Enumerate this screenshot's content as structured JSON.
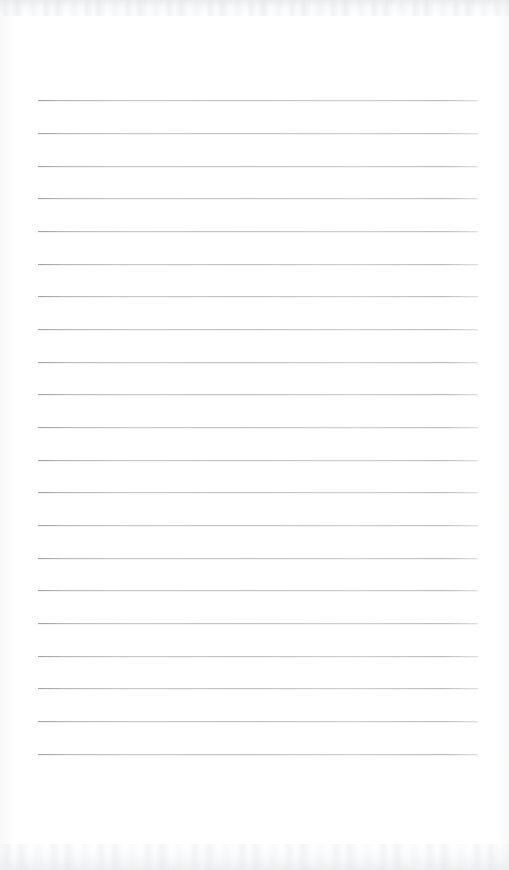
{
  "document": {
    "kind": "lined-notepad-page",
    "title": "",
    "content_text": "",
    "page_width": 509,
    "page_height": 870,
    "background_color": "#ffffff",
    "rule_color": "#b3b6bd",
    "rule_count": 21,
    "rule_left_x": 38,
    "rule_right_x": 478,
    "rule_first_y": 100,
    "rule_spacing": 32.65,
    "rule_thickness": 1,
    "has_margin_line": false,
    "is_blank": true
  },
  "rules": [
    {
      "index": 1,
      "y": 100,
      "text": ""
    },
    {
      "index": 2,
      "y": 133,
      "text": ""
    },
    {
      "index": 3,
      "y": 166,
      "text": ""
    },
    {
      "index": 4,
      "y": 198,
      "text": ""
    },
    {
      "index": 5,
      "y": 231,
      "text": ""
    },
    {
      "index": 6,
      "y": 264,
      "text": ""
    },
    {
      "index": 7,
      "y": 296,
      "text": ""
    },
    {
      "index": 8,
      "y": 329,
      "text": ""
    },
    {
      "index": 9,
      "y": 362,
      "text": ""
    },
    {
      "index": 10,
      "y": 394,
      "text": ""
    },
    {
      "index": 11,
      "y": 427,
      "text": ""
    },
    {
      "index": 12,
      "y": 460,
      "text": ""
    },
    {
      "index": 13,
      "y": 492,
      "text": ""
    },
    {
      "index": 14,
      "y": 525,
      "text": ""
    },
    {
      "index": 15,
      "y": 558,
      "text": ""
    },
    {
      "index": 16,
      "y": 590,
      "text": ""
    },
    {
      "index": 17,
      "y": 623,
      "text": ""
    },
    {
      "index": 18,
      "y": 656,
      "text": ""
    },
    {
      "index": 19,
      "y": 688,
      "text": ""
    },
    {
      "index": 20,
      "y": 721,
      "text": ""
    },
    {
      "index": 21,
      "y": 754,
      "text": ""
    }
  ]
}
